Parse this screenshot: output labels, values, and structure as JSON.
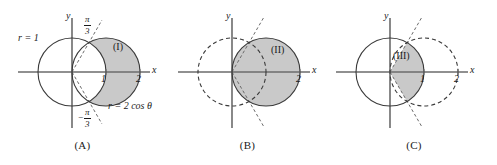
{
  "figure": {
    "type": "polar-curve-diagram",
    "colors": {
      "shade": "#c9c9c9",
      "stroke": "#3a3a3a",
      "axis": "#6b6b6b",
      "text": "#1a1a1a"
    },
    "curves": {
      "unit_circle": "r = 1",
      "cardioid_circle": "r = 2 cos θ",
      "ray_upper": "π/3",
      "ray_lower": "−π/3"
    }
  },
  "panels": [
    {
      "id": "A",
      "caption": "(A)",
      "region_label": "(I)",
      "axis_x": "x",
      "axis_y": "y",
      "ticks": [
        "1",
        "2"
      ],
      "annotations": {
        "circle_label": "r = 1",
        "curve_label": "r = 2 cos θ",
        "angle_upper_num": "π",
        "angle_upper_den": "3",
        "angle_lower_sign": "−",
        "angle_lower_num": "π",
        "angle_lower_den": "3"
      },
      "styles": {
        "unit_circle": "solid",
        "cos_circle": "solid",
        "rays": "dashed",
        "shaded": "region right of unit circle inside r = 2 cos θ"
      }
    },
    {
      "id": "B",
      "caption": "(B)",
      "region_label": "(II)",
      "axis_x": "x",
      "axis_y": "y",
      "ticks": [
        "2"
      ],
      "styles": {
        "unit_circle": "dashed",
        "cos_circle": "solid",
        "rays": "dashed",
        "shaded": "full disk r = 2 cos θ"
      }
    },
    {
      "id": "C",
      "caption": "(C)",
      "region_label": "(III)",
      "axis_x": "x",
      "axis_y": "y",
      "ticks": [
        "1",
        "2"
      ],
      "styles": {
        "unit_circle": "solid",
        "cos_circle": "dashed",
        "rays": "dashed",
        "shaded": "wedge between ±π/3 rays inside unit circle"
      }
    }
  ]
}
